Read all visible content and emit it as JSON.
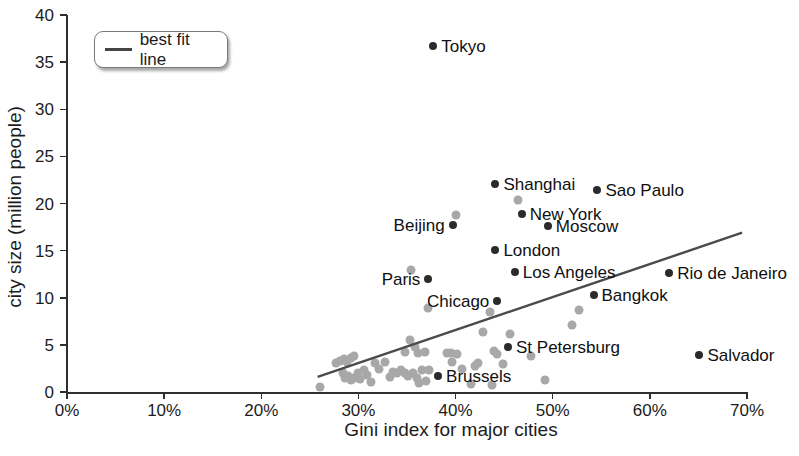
{
  "legend": {
    "label": "best fit line"
  },
  "axes": {
    "x": {
      "label": "Gini index for major cities",
      "tick_labels": [
        "0%",
        "10%",
        "20%",
        "30%",
        "40%",
        "50%",
        "60%",
        "70%"
      ],
      "min": 0,
      "max": 70
    },
    "y": {
      "label": "city size (million people)",
      "tick_labels": [
        "0",
        "5",
        "10",
        "15",
        "20",
        "25",
        "30",
        "35",
        "40"
      ],
      "min": 0,
      "max": 40
    }
  },
  "chart_data": {
    "type": "scatter",
    "title": "",
    "xlabel": "Gini index for major cities",
    "ylabel": "city size (million people)",
    "xlim": [
      0,
      70
    ],
    "ylim": [
      0,
      40
    ],
    "x_unit": "percent",
    "y_unit": "million people",
    "grid": false,
    "legend_position": "top-left",
    "colors": {
      "labeled_point": "#2b2b2b",
      "unlabeled_point": "#a8a8a8",
      "best_fit_line": "#4a4a4a",
      "axis": "#2f2f2f",
      "text": "#1c1c1c"
    },
    "series": [
      {
        "name": "labeled cities",
        "points": [
          {
            "city": "Tokyo",
            "gini_pct": 37.7,
            "size_millions": 36.7,
            "label_side": "right"
          },
          {
            "city": "Shanghai",
            "gini_pct": 44.1,
            "size_millions": 22.1,
            "label_side": "right"
          },
          {
            "city": "Sao Paulo",
            "gini_pct": 54.6,
            "size_millions": 21.4,
            "label_side": "right"
          },
          {
            "city": "New York",
            "gini_pct": 46.8,
            "size_millions": 18.9,
            "label_side": "right"
          },
          {
            "city": "Beijing",
            "gini_pct": 39.7,
            "size_millions": 17.7,
            "label_side": "left"
          },
          {
            "city": "Moscow",
            "gini_pct": 49.5,
            "size_millions": 17.6,
            "label_side": "right"
          },
          {
            "city": "London",
            "gini_pct": 44.1,
            "size_millions": 15.1,
            "label_side": "right"
          },
          {
            "city": "Los Angeles",
            "gini_pct": 46.1,
            "size_millions": 12.7,
            "label_side": "right"
          },
          {
            "city": "Rio de Janeiro",
            "gini_pct": 62.0,
            "size_millions": 12.6,
            "label_side": "right"
          },
          {
            "city": "Paris",
            "gini_pct": 37.2,
            "size_millions": 12.0,
            "label_side": "left"
          },
          {
            "city": "Bangkok",
            "gini_pct": 54.2,
            "size_millions": 10.3,
            "label_side": "right"
          },
          {
            "city": "Chicago",
            "gini_pct": 44.3,
            "size_millions": 9.7,
            "label_side": "left"
          },
          {
            "city": "St Petersburg",
            "gini_pct": 45.4,
            "size_millions": 4.8,
            "label_side": "right"
          },
          {
            "city": "Salvador",
            "gini_pct": 65.1,
            "size_millions": 3.9,
            "label_side": "right"
          },
          {
            "city": "Brussels",
            "gini_pct": 38.2,
            "size_millions": 1.7,
            "label_side": "right"
          }
        ]
      },
      {
        "name": "unlabeled cities",
        "points_xy": [
          [
            40.0,
            18.8
          ],
          [
            46.4,
            20.4
          ],
          [
            35.4,
            12.9
          ],
          [
            37.2,
            8.9
          ],
          [
            35.3,
            5.5
          ],
          [
            35.8,
            4.8
          ],
          [
            34.8,
            4.2
          ],
          [
            43.5,
            8.5
          ],
          [
            42.8,
            6.4
          ],
          [
            45.6,
            6.2
          ],
          [
            44.0,
            4.3
          ],
          [
            44.3,
            4.0
          ],
          [
            52.7,
            8.7
          ],
          [
            52.0,
            7.1
          ],
          [
            47.8,
            3.8
          ],
          [
            49.2,
            1.3
          ],
          [
            44.9,
            3.0
          ],
          [
            43.7,
            0.7
          ],
          [
            41.6,
            0.8
          ],
          [
            42.0,
            2.8
          ],
          [
            42.3,
            3.1
          ],
          [
            40.7,
            2.4
          ],
          [
            39.6,
            3.2
          ],
          [
            39.1,
            4.1
          ],
          [
            39.5,
            4.1
          ],
          [
            40.1,
            4.0
          ],
          [
            36.9,
            4.2
          ],
          [
            36.1,
            4.1
          ],
          [
            36.2,
            1.0
          ],
          [
            37.3,
            2.3
          ],
          [
            27.7,
            3.1
          ],
          [
            28.1,
            3.3
          ],
          [
            28.5,
            3.5
          ],
          [
            28.8,
            3.2
          ],
          [
            29.2,
            3.6
          ],
          [
            29.5,
            3.8
          ],
          [
            28.4,
            2.0
          ],
          [
            28.6,
            1.5
          ],
          [
            28.9,
            1.7
          ],
          [
            29.2,
            1.3
          ],
          [
            29.5,
            1.5
          ],
          [
            30.0,
            2.0
          ],
          [
            30.2,
            1.4
          ],
          [
            30.6,
            2.3
          ],
          [
            30.9,
            1.8
          ],
          [
            31.3,
            1.1
          ],
          [
            31.7,
            3.1
          ],
          [
            32.1,
            2.4
          ],
          [
            32.7,
            3.2
          ],
          [
            33.2,
            1.6
          ],
          [
            33.6,
            2.1
          ],
          [
            34.0,
            2.0
          ],
          [
            34.4,
            2.3
          ],
          [
            34.8,
            2.0
          ],
          [
            35.1,
            1.7
          ],
          [
            35.6,
            2.0
          ],
          [
            36.0,
            1.5
          ],
          [
            36.5,
            2.3
          ],
          [
            37.0,
            1.2
          ],
          [
            26.0,
            0.5
          ]
        ]
      }
    ],
    "best_fit_line": {
      "x1": 25.8,
      "y1": 1.6,
      "x2": 69.5,
      "y2": 16.9
    }
  }
}
